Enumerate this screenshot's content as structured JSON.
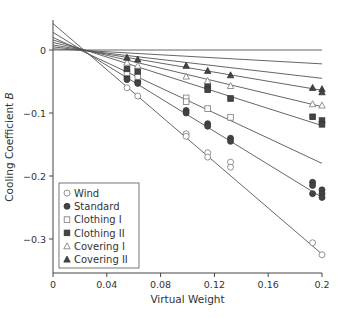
{
  "chart_data": {
    "type": "scatter",
    "title": "",
    "xlabel": "Virtual Weight",
    "ylabel": "Cooling Coefficient B",
    "ylabel_plain": "Cooling Coefficient ",
    "ylabel_italic": "B",
    "xlim": [
      0,
      0.2
    ],
    "ylim": [
      -0.35,
      0.045
    ],
    "x_ticks": [
      0,
      0.04,
      0.08,
      0.12,
      0.16,
      0.2
    ],
    "x_tick_labels": [
      "0",
      "0.04",
      "0.08",
      "0.12",
      "0.16",
      "0.2"
    ],
    "y_ticks": [
      0,
      -0.1,
      -0.2,
      -0.3
    ],
    "y_tick_labels": [
      "0",
      "−0.1",
      "−0.2",
      "−0.3"
    ],
    "grid": false,
    "legend_position": "lower left",
    "reference_line": {
      "y": 0,
      "x_range": [
        0,
        0.2
      ]
    },
    "series": [
      {
        "name": "Wind",
        "marker": "circle-open",
        "fit": {
          "intercept": 0.042,
          "slope": -1.83
        },
        "points": [
          [
            0.055,
            -0.06
          ],
          [
            0.063,
            -0.073
          ],
          [
            0.099,
            -0.133
          ],
          [
            0.099,
            -0.137
          ],
          [
            0.115,
            -0.163
          ],
          [
            0.115,
            -0.17
          ],
          [
            0.132,
            -0.178
          ],
          [
            0.132,
            -0.186
          ],
          [
            0.193,
            -0.306
          ],
          [
            0.2,
            -0.325
          ]
        ]
      },
      {
        "name": "Standard",
        "marker": "circle-filled",
        "fit": {
          "intercept": 0.028,
          "slope": -1.31
        },
        "points": [
          [
            0.055,
            -0.043
          ],
          [
            0.055,
            -0.047
          ],
          [
            0.063,
            -0.05
          ],
          [
            0.063,
            -0.053
          ],
          [
            0.099,
            -0.096
          ],
          [
            0.099,
            -0.1
          ],
          [
            0.115,
            -0.117
          ],
          [
            0.115,
            -0.121
          ],
          [
            0.132,
            -0.14
          ],
          [
            0.132,
            -0.145
          ],
          [
            0.193,
            -0.21
          ],
          [
            0.193,
            -0.215
          ],
          [
            0.193,
            -0.228
          ],
          [
            0.2,
            -0.222
          ],
          [
            0.2,
            -0.228
          ],
          [
            0.2,
            -0.234
          ]
        ]
      },
      {
        "name": "Clothing I",
        "marker": "square-open",
        "fit": {
          "intercept": 0.02,
          "slope": -1.0
        },
        "points": [
          [
            0.055,
            -0.036
          ],
          [
            0.063,
            -0.042
          ],
          [
            0.099,
            -0.076
          ],
          [
            0.099,
            -0.082
          ],
          [
            0.115,
            -0.093
          ],
          [
            0.132,
            -0.107
          ]
        ]
      },
      {
        "name": "Clothing II",
        "marker": "square-filled",
        "fit": {
          "intercept": 0.016,
          "slope": -0.68
        },
        "points": [
          [
            0.055,
            -0.03
          ],
          [
            0.063,
            -0.034
          ],
          [
            0.115,
            -0.057
          ],
          [
            0.115,
            -0.063
          ],
          [
            0.132,
            -0.077
          ],
          [
            0.193,
            -0.106
          ],
          [
            0.2,
            -0.112
          ],
          [
            0.2,
            -0.118
          ]
        ]
      },
      {
        "name": "Covering I",
        "marker": "triangle-open",
        "fit": {
          "intercept": 0.012,
          "slope": -0.51
        },
        "points": [
          [
            0.055,
            -0.02
          ],
          [
            0.063,
            -0.025
          ],
          [
            0.099,
            -0.042
          ],
          [
            0.115,
            -0.049
          ],
          [
            0.132,
            -0.057
          ],
          [
            0.193,
            -0.086
          ],
          [
            0.2,
            -0.088
          ]
        ]
      },
      {
        "name": "Covering II",
        "marker": "triangle-filled",
        "fit": {
          "intercept": 0.008,
          "slope": -0.36
        },
        "points": [
          [
            0.055,
            -0.012
          ],
          [
            0.063,
            -0.015
          ],
          [
            0.099,
            -0.025
          ],
          [
            0.115,
            -0.033
          ],
          [
            0.132,
            -0.04
          ],
          [
            0.193,
            -0.06
          ],
          [
            0.2,
            -0.062
          ],
          [
            0.2,
            -0.067
          ]
        ]
      }
    ],
    "extra_fit_lines": [
      {
        "intercept": 0.005,
        "slope": -0.25
      },
      {
        "intercept": 0.002,
        "slope": -0.12
      }
    ]
  },
  "legend": {
    "items": [
      "Wind",
      "Standard",
      "Clothing I",
      "Clothing II",
      "Covering I",
      "Covering II"
    ]
  }
}
